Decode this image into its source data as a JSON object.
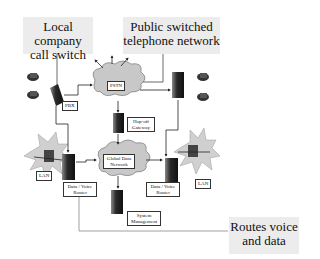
{
  "callouts": {
    "pbx": "Local company call switch",
    "pbx_line1": "Local company",
    "pbx_line2": "call switch",
    "pstn": "Public switched telephone network",
    "pstn_line1": "Public switched",
    "pstn_line2": "telephone network",
    "routes": "Routes voice and data",
    "routes_line1": "Routes voice",
    "routes_line2": "and data"
  },
  "nodes": {
    "pstn_cloud": "PSTN",
    "pbx": "PBX",
    "gateway_line1": "Hop-off",
    "gateway_line2": "Gateway",
    "global_line1": "Global Data",
    "global_line2": "Network",
    "router_left_line1": "Data / Voice",
    "router_left_line2": "Router",
    "router_right_line1": "Data / Voice",
    "router_right_line2": "Router",
    "lan_left": "LAN",
    "lan_right": "LAN",
    "sysmgmt_line1": "System",
    "sysmgmt_line2": "Management"
  },
  "colors": {
    "callout_bg": "#ececec",
    "cloud": "#c8c8c8",
    "burst": "#d0d0d0",
    "device": "#3a3a3a"
  }
}
